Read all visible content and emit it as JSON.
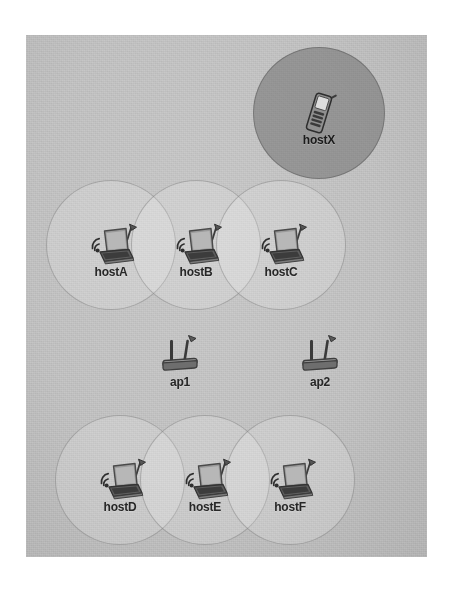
{
  "scene": {
    "title": "Mininet-WiFi network topology",
    "background_color": "#ffffff",
    "canvas_color": "#bdbdbd",
    "canvas": {
      "x": 26,
      "y": 35,
      "width": 401,
      "height": 522
    },
    "range_circle_fill": "#ffffff2b",
    "range_circle_stroke": "#696969",
    "highlight_circle_fill": "#606060"
  },
  "nodes": [
    {
      "id": "hostX",
      "label": "hostX",
      "type": "mobile-station",
      "icon": "mobile-phone-icon",
      "x": 319,
      "y": 113,
      "range_radius": 66,
      "range_style": "highlighted"
    },
    {
      "id": "hostA",
      "label": "hostA",
      "type": "station",
      "icon": "laptop-wireless-icon",
      "x": 111,
      "y": 245,
      "range_radius": 65,
      "range_style": "normal"
    },
    {
      "id": "hostB",
      "label": "hostB",
      "type": "station",
      "icon": "laptop-wireless-icon",
      "x": 196,
      "y": 245,
      "range_radius": 65,
      "range_style": "normal"
    },
    {
      "id": "hostC",
      "label": "hostC",
      "type": "station",
      "icon": "laptop-wireless-icon",
      "x": 281,
      "y": 245,
      "range_radius": 65,
      "range_style": "normal"
    },
    {
      "id": "ap1",
      "label": "ap1",
      "type": "access-point",
      "icon": "access-point-icon",
      "x": 180,
      "y": 355,
      "range_radius": 0,
      "range_style": "none"
    },
    {
      "id": "ap2",
      "label": "ap2",
      "type": "access-point",
      "icon": "access-point-icon",
      "x": 320,
      "y": 355,
      "range_radius": 0,
      "range_style": "none"
    },
    {
      "id": "hostD",
      "label": "hostD",
      "type": "station",
      "icon": "laptop-wireless-icon",
      "x": 120,
      "y": 480,
      "range_radius": 65,
      "range_style": "normal"
    },
    {
      "id": "hostE",
      "label": "hostE",
      "type": "station",
      "icon": "laptop-wireless-icon",
      "x": 205,
      "y": 480,
      "range_radius": 65,
      "range_style": "normal"
    },
    {
      "id": "hostF",
      "label": "hostF",
      "type": "station",
      "icon": "laptop-wireless-icon",
      "x": 290,
      "y": 480,
      "range_radius": 65,
      "range_style": "normal"
    }
  ]
}
